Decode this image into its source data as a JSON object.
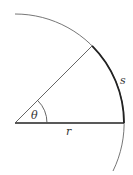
{
  "diagram": {
    "type": "arc-length-radian",
    "labels": {
      "angle": "θ",
      "radius": "r",
      "arc_length": "s"
    },
    "geometry": {
      "center": [
        15,
        123
      ],
      "radius_px": 109,
      "angle_deg": 45
    },
    "colors": {
      "stroke": "#555555",
      "bold_stroke": "#222222",
      "text": "#333333",
      "background": "#ffffff"
    }
  }
}
